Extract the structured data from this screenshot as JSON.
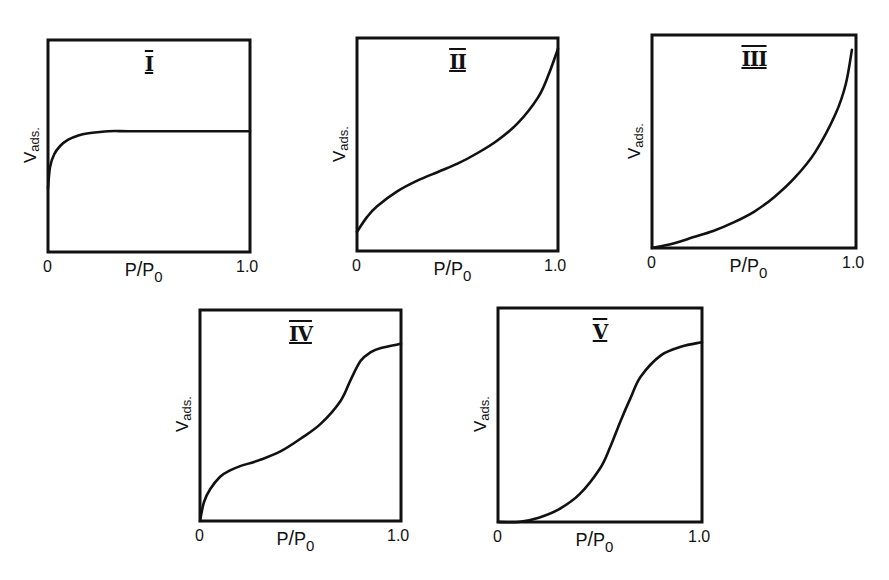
{
  "figure": {
    "panels": [
      {
        "id": "I",
        "numeral": "I",
        "ylabel_main": "V",
        "ylabel_sub": "ads.",
        "xlabel_main": "P",
        "xlabel_slash": "/",
        "xlabel_sub_p": "P",
        "xlabel_sub": "0",
        "x_min_label": "0",
        "x_max_label": "1.0"
      },
      {
        "id": "II",
        "numeral": "II",
        "ylabel_main": "V",
        "ylabel_sub": "ads.",
        "xlabel_main": "P",
        "xlabel_slash": "/",
        "xlabel_sub_p": "P",
        "xlabel_sub": "0",
        "x_min_label": "0",
        "x_max_label": "1.0"
      },
      {
        "id": "III",
        "numeral": "III",
        "ylabel_main": "V",
        "ylabel_sub": "ads.",
        "xlabel_main": "P",
        "xlabel_slash": "/",
        "xlabel_sub_p": "P",
        "xlabel_sub": "0",
        "x_min_label": "0",
        "x_max_label": "1.0"
      },
      {
        "id": "IV",
        "numeral": "IV",
        "ylabel_main": "V",
        "ylabel_sub": "ads.",
        "xlabel_main": "P",
        "xlabel_slash": "/",
        "xlabel_sub_p": "P",
        "xlabel_sub": "0",
        "x_min_label": "0",
        "x_max_label": "1.0"
      },
      {
        "id": "V",
        "numeral": "V",
        "ylabel_main": "V",
        "ylabel_sub": "ads.",
        "xlabel_main": "P",
        "xlabel_slash": "/",
        "xlabel_sub_p": "P",
        "xlabel_sub": "0",
        "x_min_label": "0",
        "x_max_label": "1.0"
      }
    ]
  },
  "chart_data": [
    {
      "type": "line",
      "title": "I",
      "xlabel": "P/P0",
      "ylabel": "Vads.",
      "xlim": [
        0,
        1.0
      ],
      "ylim": [
        0,
        1
      ],
      "grid": false,
      "legend": false,
      "x_tick_labels": [
        "0",
        "1.0"
      ],
      "x": [
        0,
        0.01,
        0.03,
        0.06,
        0.1,
        0.15,
        0.2,
        0.3,
        0.4,
        0.6,
        0.8,
        1.0
      ],
      "values": [
        0.3,
        0.4,
        0.46,
        0.5,
        0.53,
        0.55,
        0.56,
        0.57,
        0.57,
        0.57,
        0.57,
        0.57
      ]
    },
    {
      "type": "line",
      "title": "II",
      "xlabel": "P/P0",
      "ylabel": "Vads.",
      "xlim": [
        0,
        1.0
      ],
      "ylim": [
        0,
        1
      ],
      "grid": false,
      "legend": false,
      "x_tick_labels": [
        "0",
        "1.0"
      ],
      "x": [
        0,
        0.05,
        0.1,
        0.2,
        0.3,
        0.4,
        0.5,
        0.6,
        0.7,
        0.8,
        0.9,
        0.95,
        1.0
      ],
      "values": [
        0.09,
        0.16,
        0.21,
        0.28,
        0.33,
        0.37,
        0.41,
        0.46,
        0.52,
        0.6,
        0.72,
        0.82,
        0.95
      ]
    },
    {
      "type": "line",
      "title": "III",
      "xlabel": "P/P0",
      "ylabel": "Vads.",
      "xlim": [
        0,
        1.0
      ],
      "ylim": [
        0,
        1
      ],
      "grid": false,
      "legend": false,
      "x_tick_labels": [
        "0",
        "1.0"
      ],
      "x": [
        0,
        0.1,
        0.2,
        0.3,
        0.4,
        0.5,
        0.6,
        0.7,
        0.8,
        0.9,
        0.95,
        0.98
      ],
      "values": [
        0.0,
        0.02,
        0.05,
        0.08,
        0.12,
        0.17,
        0.24,
        0.33,
        0.45,
        0.63,
        0.77,
        0.93
      ]
    },
    {
      "type": "line",
      "title": "IV",
      "xlabel": "P/P0",
      "ylabel": "Vads.",
      "xlim": [
        0,
        1.0
      ],
      "ylim": [
        0,
        1
      ],
      "grid": false,
      "legend": false,
      "x_tick_labels": [
        "0",
        "1.0"
      ],
      "x": [
        0,
        0.02,
        0.05,
        0.1,
        0.15,
        0.2,
        0.3,
        0.4,
        0.5,
        0.6,
        0.7,
        0.75,
        0.8,
        0.85,
        0.9,
        1.0
      ],
      "values": [
        0.0,
        0.09,
        0.15,
        0.21,
        0.24,
        0.26,
        0.29,
        0.33,
        0.39,
        0.46,
        0.57,
        0.67,
        0.76,
        0.8,
        0.82,
        0.84
      ]
    },
    {
      "type": "line",
      "title": "V",
      "xlabel": "P/P0",
      "ylabel": "Vads.",
      "xlim": [
        0,
        1.0
      ],
      "ylim": [
        0,
        1
      ],
      "grid": false,
      "legend": false,
      "x_tick_labels": [
        "0",
        "1.0"
      ],
      "x": [
        0,
        0.1,
        0.2,
        0.3,
        0.4,
        0.5,
        0.55,
        0.6,
        0.65,
        0.7,
        0.8,
        0.9,
        1.0
      ],
      "values": [
        0.0,
        0.0,
        0.02,
        0.06,
        0.13,
        0.25,
        0.35,
        0.47,
        0.58,
        0.68,
        0.78,
        0.82,
        0.84
      ]
    }
  ]
}
